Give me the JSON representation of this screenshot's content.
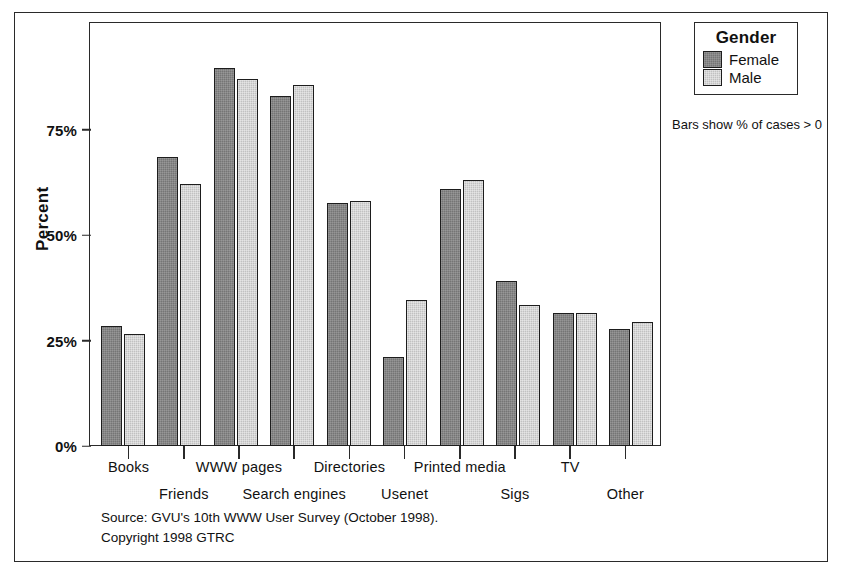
{
  "chart_data": {
    "type": "bar",
    "title": "",
    "xlabel": "",
    "ylabel": "Percent",
    "ylim": [
      0,
      100
    ],
    "ytick_values": [
      75,
      50,
      25,
      0
    ],
    "ytick_labels": [
      "75%",
      "50%",
      "25%",
      "0%"
    ],
    "grid": false,
    "legend_position": "top-right-outside",
    "legend_title": "Gender",
    "annotation": "Bars show % of cases > 0",
    "categories": [
      "Books",
      "Friends",
      "WWW pages",
      "Search engines",
      "Directories",
      "Usenet",
      "Printed media",
      "Sigs",
      "TV",
      "Other"
    ],
    "series": [
      {
        "name": "Female",
        "color": "#757575",
        "values": [
          28.5,
          68.5,
          89.5,
          83.0,
          57.5,
          21.0,
          61.0,
          39.0,
          31.5,
          27.8
        ]
      },
      {
        "name": "Male",
        "color": "#c1c1c1",
        "values": [
          26.5,
          62.0,
          87.0,
          85.5,
          58.0,
          34.5,
          63.0,
          33.5,
          31.5,
          29.3
        ]
      }
    ]
  },
  "axes": {
    "y_label": "Percent",
    "y_ticks": [
      "75%",
      "50%",
      "25%",
      "0%"
    ],
    "x_categories": [
      "Books",
      "Friends",
      "WWW pages",
      "Search engines",
      "Directories",
      "Usenet",
      "Printed media",
      "Sigs",
      "TV",
      "Other"
    ]
  },
  "legend": {
    "title": "Gender",
    "items": [
      {
        "label": "Female",
        "color": "#757575"
      },
      {
        "label": "Male",
        "color": "#c1c1c1"
      }
    ],
    "note": "Bars show % of cases > 0"
  },
  "footer": {
    "line1": "Source: GVU's 10th WWW User Survey (October 1998).",
    "line2": "Copyright 1998 GTRC"
  }
}
